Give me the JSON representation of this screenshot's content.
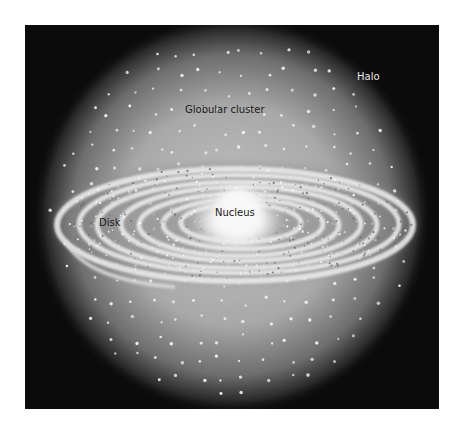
{
  "diagram": {
    "labels": {
      "halo": "Halo",
      "globular_cluster": "Globular cluster",
      "nucleus": "Nucleus",
      "disk": "Disk"
    },
    "colors": {
      "background": "#0b0b0b",
      "halo_center": "#bdbdbd",
      "halo_edge": "#0b0b0b",
      "star": "#f4f4f4",
      "disk_ring": "#e6e6e6",
      "nucleus": "#f7f7f7",
      "page": "#ffffff"
    },
    "components": [
      "Halo",
      "Globular clusters",
      "Disk with spiral arms",
      "Nucleus"
    ]
  }
}
